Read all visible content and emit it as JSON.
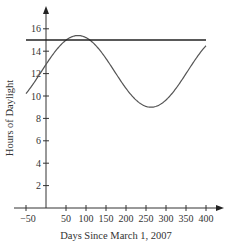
{
  "chart_data": {
    "type": "line",
    "title": "",
    "xlabel": "Days Since March 1, 2007",
    "ylabel": "Hours of Daylight",
    "xlim": [
      -50,
      400
    ],
    "ylim": [
      0,
      17
    ],
    "x_ticks": [
      -50,
      50,
      100,
      150,
      200,
      250,
      300,
      350,
      400
    ],
    "x_tick_labels": [
      "−50",
      "50",
      "100",
      "150",
      "200",
      "250",
      "300",
      "350",
      "400"
    ],
    "y_ticks": [
      2,
      4,
      6,
      8,
      10,
      12,
      14,
      16
    ],
    "y_tick_labels": [
      "2",
      "4",
      "6",
      "8",
      "10",
      "12",
      "14",
      "16"
    ],
    "grid": false,
    "legend": null,
    "series": [
      {
        "name": "Hours of daylight (sinusoid)",
        "style": "curve",
        "model": "h(t) = 12.2 + 3.2*sin(2*pi*(t + 11.25)/365)",
        "x": [
          -50,
          -25,
          0,
          25,
          50,
          80,
          100,
          125,
          150,
          175,
          200,
          225,
          262,
          275,
          300,
          325,
          350,
          375,
          400
        ],
        "values": [
          10.2,
          11.5,
          12.8,
          14.0,
          14.9,
          15.4,
          15.3,
          14.7,
          13.7,
          12.4,
          11.1,
          10.0,
          9.0,
          9.1,
          9.6,
          10.6,
          11.9,
          13.2,
          14.5
        ]
      },
      {
        "name": "Horizontal line",
        "style": "line",
        "x": [
          -50,
          400
        ],
        "values": [
          15,
          15
        ]
      }
    ]
  }
}
